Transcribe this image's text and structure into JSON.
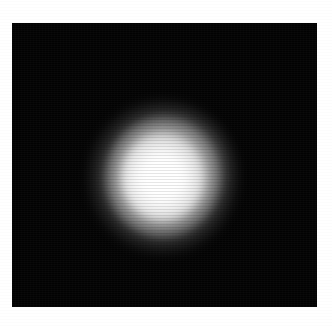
{
  "figure": {
    "kind": "grayscale-intensity-image",
    "background_color": "#ffffff",
    "plate_color": "#030303",
    "source_color": "#ffffff",
    "alt": "",
    "caption": ""
  },
  "chart_data": {
    "type": "heatmap",
    "title": "",
    "subtitle": "",
    "xlabel": "",
    "ylabel": "",
    "colormap": "grayscale",
    "grid": false,
    "legend": "none",
    "annotations": [],
    "tick_labels": {
      "x": [],
      "y": []
    },
    "axis_ranges": {
      "x_pixels": [
        0,
        305
      ],
      "y_pixels": [
        0,
        284
      ]
    },
    "features": [
      {
        "name": "primary-source",
        "center_px": {
          "x": 163,
          "y": 177
        },
        "core_radius_px": 22,
        "fwhm_px": 62,
        "outer_radius_px": 74,
        "peak_intensity": 255,
        "background_intensity": 3,
        "shape": "near-circular with slight upper-right extension"
      }
    ],
    "radial_profile": {
      "radius_px": [
        0,
        8,
        16,
        24,
        32,
        40,
        48,
        56,
        64,
        72,
        80
      ],
      "intensity": [
        255,
        255,
        253,
        242,
        212,
        163,
        108,
        58,
        25,
        8,
        2
      ]
    },
    "horizontal_cut": {
      "row_y_px": 177,
      "x_px": [
        100,
        110,
        120,
        130,
        140,
        150,
        160,
        170,
        180,
        190,
        200,
        210,
        220
      ],
      "intensity": [
        6,
        22,
        62,
        128,
        197,
        243,
        255,
        252,
        226,
        170,
        104,
        44,
        12
      ]
    },
    "vertical_cut": {
      "column_x_px": 163,
      "y_px": [
        110,
        120,
        130,
        140,
        150,
        160,
        170,
        180,
        190,
        200,
        210,
        220,
        232
      ],
      "intensity": [
        5,
        20,
        58,
        122,
        191,
        238,
        255,
        254,
        231,
        176,
        108,
        46,
        10
      ]
    },
    "plate_bounds_px": {
      "left": 12,
      "top": 23,
      "width": 305,
      "height": 284
    }
  }
}
